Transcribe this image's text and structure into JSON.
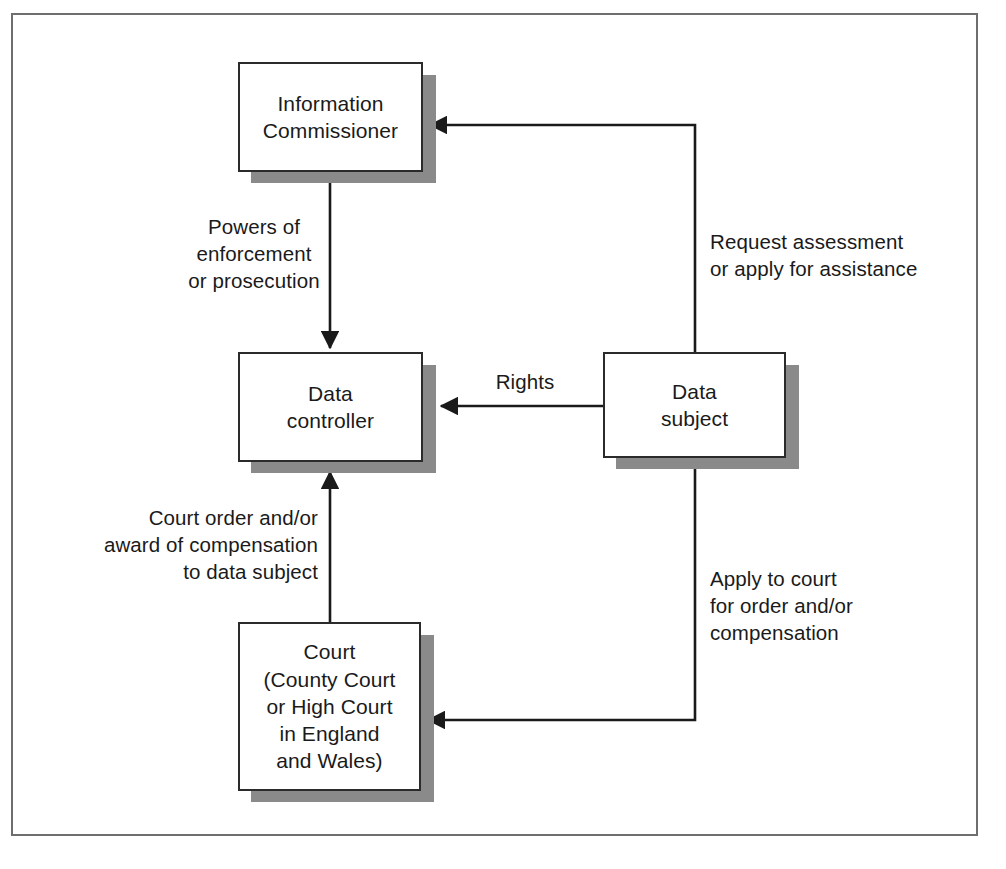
{
  "diagram": {
    "frame_color": "#6e6e6e",
    "node_border_color": "#2b2b2b",
    "node_shadow_color": "#8a8a8a",
    "connector_color": "#1a1a1a",
    "nodes": [
      {
        "id": "information-commissioner",
        "label": "Information\nCommissioner"
      },
      {
        "id": "data-controller",
        "label": "Data\ncontroller"
      },
      {
        "id": "data-subject",
        "label": "Data\nsubject"
      },
      {
        "id": "court",
        "label": "Court\n(County Court\nor High Court\nin England\nand Wales)"
      }
    ],
    "edges": [
      {
        "id": "powers-of-enforcement",
        "label": "Powers of\nenforcement\nor prosecution",
        "from": "information-commissioner",
        "to": "data-controller"
      },
      {
        "id": "request-assessment",
        "label": "Request assessment\nor apply for assistance",
        "from": "data-subject",
        "to": "information-commissioner"
      },
      {
        "id": "rights",
        "label": "Rights",
        "from": "data-subject",
        "to": "data-controller"
      },
      {
        "id": "apply-to-court",
        "label": "Apply to court\nfor order and/or\ncompensation",
        "from": "data-subject",
        "to": "court"
      },
      {
        "id": "court-order",
        "label": "Court order and/or\naward of compensation\nto data subject",
        "from": "court",
        "to": "data-controller"
      }
    ]
  }
}
